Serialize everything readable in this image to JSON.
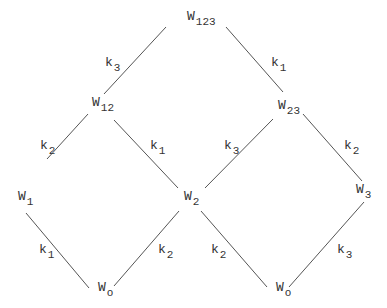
{
  "diagram": {
    "nodes": [
      {
        "id": "W123",
        "base": "W",
        "sub": "123",
        "x": 187,
        "y": 10
      },
      {
        "id": "W12",
        "base": "W",
        "sub": "12",
        "x": 92,
        "y": 96
      },
      {
        "id": "W23",
        "base": "W",
        "sub": "23",
        "x": 278,
        "y": 99
      },
      {
        "id": "W1",
        "base": "W",
        "sub": "1",
        "x": 18,
        "y": 190
      },
      {
        "id": "W2",
        "base": "W",
        "sub": "2",
        "x": 184,
        "y": 190
      },
      {
        "id": "W3",
        "base": "W",
        "sub": "3",
        "x": 356,
        "y": 183
      },
      {
        "id": "Wo_left",
        "base": "W",
        "sub": "o",
        "x": 98,
        "y": 281
      },
      {
        "id": "Wo_right",
        "base": "W",
        "sub": "o",
        "x": 276,
        "y": 281
      }
    ],
    "edges": [
      {
        "from": "W12",
        "to": "W123",
        "label": "k",
        "sub": "3",
        "x1": 104,
        "y1": 94,
        "x2": 166,
        "y2": 27,
        "lx": 105,
        "ly": 56
      },
      {
        "from": "W23",
        "to": "W123",
        "label": "k",
        "sub": "1",
        "x1": 283,
        "y1": 92,
        "x2": 226,
        "y2": 27,
        "lx": 271,
        "ly": 56
      },
      {
        "from": "W1",
        "to": "W12",
        "label": "k",
        "sub": "2",
        "x1": 47,
        "y1": 159,
        "x2": 88,
        "y2": 114,
        "lx": 40,
        "ly": 139
      },
      {
        "from": "W2",
        "to": "W12",
        "label": "k",
        "sub": "1",
        "x1": 178,
        "y1": 188,
        "x2": 114,
        "y2": 120,
        "lx": 150,
        "ly": 139
      },
      {
        "from": "W2",
        "to": "W23",
        "label": "k",
        "sub": "3",
        "x1": 205,
        "y1": 188,
        "x2": 273,
        "y2": 119,
        "lx": 224,
        "ly": 139
      },
      {
        "from": "W3",
        "to": "W23",
        "label": "k",
        "sub": "2",
        "x1": 362,
        "y1": 181,
        "x2": 303,
        "y2": 114,
        "lx": 344,
        "ly": 139
      },
      {
        "from": "Wo_left",
        "to": "W1",
        "label": "k",
        "sub": "1",
        "x1": 89,
        "y1": 288,
        "x2": 26,
        "y2": 213,
        "lx": 39,
        "ly": 243
      },
      {
        "from": "Wo_left",
        "to": "W2",
        "label": "k",
        "sub": "2",
        "x1": 114,
        "y1": 286,
        "x2": 179,
        "y2": 211,
        "lx": 158,
        "ly": 243
      },
      {
        "from": "Wo_right",
        "to": "W2",
        "label": "k",
        "sub": "2",
        "x1": 267,
        "y1": 287,
        "x2": 201,
        "y2": 211,
        "lx": 211,
        "ly": 243
      },
      {
        "from": "Wo_right",
        "to": "W3",
        "label": "k",
        "sub": "3",
        "x1": 289,
        "y1": 287,
        "x2": 364,
        "y2": 202,
        "lx": 337,
        "ly": 243
      }
    ],
    "line_color": "#555555",
    "text_color": "#333333"
  }
}
